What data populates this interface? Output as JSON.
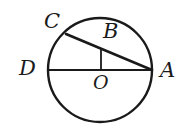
{
  "figure": {
    "kind": "circle-geometry-diagram",
    "background_color": "#ffffff",
    "stroke_color": "#1a1a1a",
    "labels": {
      "C": "C",
      "B": "B",
      "D": "D",
      "O": "O",
      "A": "A"
    },
    "geometry": {
      "circle": {
        "cx": 100,
        "cy": 70,
        "r": 52,
        "stroke_width": 2.4
      },
      "diameter_DA": {
        "x1": 48,
        "y1": 70,
        "x2": 152,
        "y2": 70,
        "stroke_width": 1.9
      },
      "chord_CA": {
        "x1": 66,
        "y1": 34,
        "x2": 152,
        "y2": 70,
        "stroke_width": 2.6
      },
      "segment_OB": {
        "x1": 101,
        "y1": 70,
        "x2": 101,
        "y2": 50,
        "stroke_width": 1.8
      }
    },
    "points": {
      "C": {
        "x": 66,
        "y": 34
      },
      "B": {
        "x": 101,
        "y": 50
      },
      "D": {
        "x": 48,
        "y": 70
      },
      "O": {
        "x": 100,
        "y": 70
      },
      "A": {
        "x": 152,
        "y": 70
      }
    }
  }
}
